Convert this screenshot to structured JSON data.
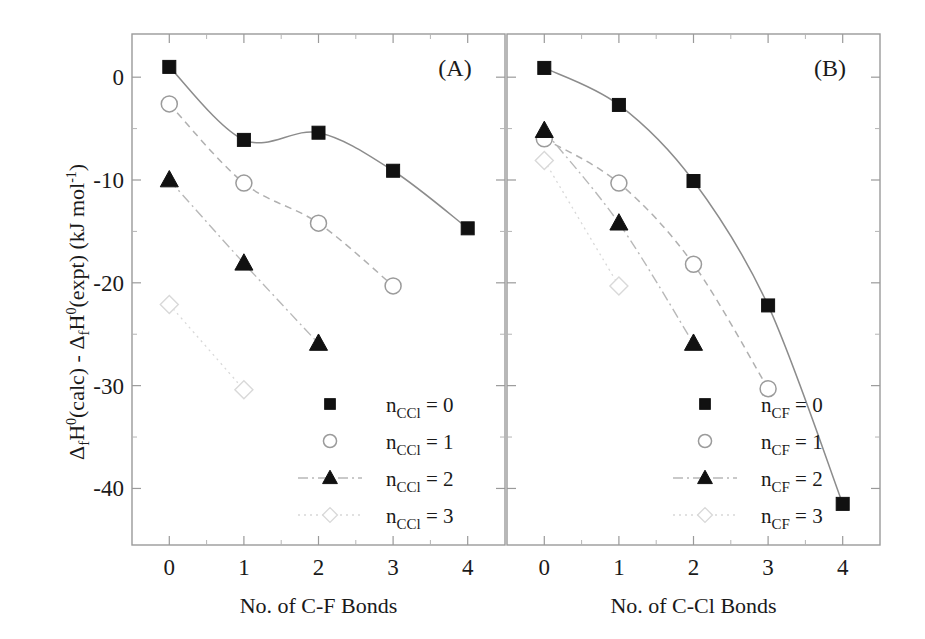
{
  "figure": {
    "ylabel_parts": {
      "d1": "Δ",
      "f1": "f",
      "h1": "H",
      "sup1": "0",
      "calc": "(calc) - ",
      "d2": "Δ",
      "f2": "f",
      "h2": "H",
      "sup2": "0",
      "expt": "(expt)  (kJ mol",
      "sup3": "-1",
      "close": ")"
    },
    "ylabel_plain": "ΔfH0(calc) - ΔfH0(expt) (kJ mol-1)",
    "y_ticks": [
      "0",
      "-10",
      "-20",
      "-30",
      "-40"
    ],
    "y_tick_values": [
      0,
      -10,
      -20,
      -30,
      -40
    ],
    "y_minor_values": [
      -5,
      -15,
      -25,
      -35
    ],
    "ylim": [
      -45.5,
      4.2
    ],
    "x_ticks": [
      "0",
      "1",
      "2",
      "3",
      "4"
    ],
    "x_tick_values": [
      0,
      1,
      2,
      3,
      4
    ],
    "xlim": [
      -0.5,
      4.5
    ],
    "grid": false,
    "legend_position": "lower-right-inside"
  },
  "chart_data": [
    {
      "id": "panel-a",
      "type": "scatter",
      "panel_label": "(A)",
      "title": "",
      "xlabel": "No. of C-F Bonds",
      "ylabel": "ΔfH0(calc) - ΔfH0(expt) (kJ mol-1)",
      "xlim": [
        -0.5,
        4.5
      ],
      "ylim": [
        -45.5,
        4.2
      ],
      "x": [
        0,
        1,
        2,
        3,
        4
      ],
      "series": [
        {
          "name": "n_CCl = 0",
          "legend_base": "n",
          "legend_sub": "CCl",
          "legend_value": "= 0",
          "marker": "filled-square",
          "line": "solid",
          "x": [
            0,
            1,
            2,
            3,
            4
          ],
          "values": [
            1.0,
            -6.1,
            -5.4,
            -9.1,
            -14.7
          ]
        },
        {
          "name": "n_CCl = 1",
          "legend_base": "n",
          "legend_sub": "CCl",
          "legend_value": "= 1",
          "marker": "open-circle",
          "line": "dashed",
          "x": [
            0,
            1,
            2,
            3
          ],
          "values": [
            -2.6,
            -10.3,
            -14.2,
            -20.3
          ]
        },
        {
          "name": "n_CCl = 2",
          "legend_base": "n",
          "legend_sub": "CCl",
          "legend_value": "= 2",
          "marker": "filled-triangle",
          "line": "dash-dot",
          "x": [
            0,
            1,
            2
          ],
          "values": [
            -10.0,
            -18.1,
            -25.9
          ]
        },
        {
          "name": "n_CCl = 3",
          "legend_base": "n",
          "legend_sub": "CCl",
          "legend_value": "= 3",
          "marker": "open-diamond",
          "line": "dotted",
          "x": [
            0,
            1
          ],
          "values": [
            -22.1,
            -30.4
          ]
        }
      ]
    },
    {
      "id": "panel-b",
      "type": "scatter",
      "panel_label": "(B)",
      "title": "",
      "xlabel": "No. of C-Cl Bonds",
      "ylabel": "",
      "xlim": [
        -0.5,
        4.5
      ],
      "ylim": [
        -45.5,
        4.2
      ],
      "x": [
        0,
        1,
        2,
        3,
        4
      ],
      "series": [
        {
          "name": "n_CF = 0",
          "legend_base": "n",
          "legend_sub": "CF",
          "legend_value": "= 0",
          "marker": "filled-square",
          "line": "solid",
          "x": [
            0,
            1,
            2,
            3,
            4
          ],
          "values": [
            0.9,
            -2.7,
            -10.1,
            -22.2,
            -41.5
          ]
        },
        {
          "name": "n_CF = 1",
          "legend_base": "n",
          "legend_sub": "CF",
          "legend_value": "= 1",
          "marker": "open-circle",
          "line": "dashed",
          "x": [
            0,
            1,
            2,
            3
          ],
          "values": [
            -6.0,
            -10.3,
            -18.2,
            -30.3
          ]
        },
        {
          "name": "n_CF = 2",
          "legend_base": "n",
          "legend_sub": "CF",
          "legend_value": "= 2",
          "marker": "filled-triangle",
          "line": "dash-dot",
          "x": [
            0,
            1,
            2
          ],
          "values": [
            -5.2,
            -14.2,
            -25.9
          ]
        },
        {
          "name": "n_CF = 3",
          "legend_base": "n",
          "legend_sub": "CF",
          "legend_value": "= 3",
          "marker": "open-diamond",
          "line": "dotted",
          "x": [
            0,
            1
          ],
          "values": [
            -8.1,
            -20.3
          ]
        }
      ]
    }
  ],
  "colors": {
    "marker_fill": "#111111",
    "open_marker_stroke": "#9b9b9b",
    "axis": "#9a9a9a",
    "text": "#1a1a1a",
    "background": "#ffffff"
  }
}
